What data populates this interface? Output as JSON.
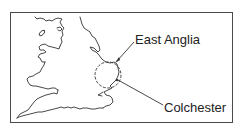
{
  "map": {
    "labels": {
      "region": "East Anglia",
      "town": "Colchester"
    },
    "colors": {
      "line": "#333333",
      "frame": "#4a4a4a",
      "background": "#ffffff"
    },
    "features": [
      {
        "name": "coastline-england-wales",
        "type": "outline"
      },
      {
        "name": "east-anglia-region",
        "type": "dashed-circle"
      },
      {
        "name": "east-anglia-pointer",
        "type": "arrow"
      },
      {
        "name": "colchester-pointer",
        "type": "leader-line"
      }
    ]
  }
}
